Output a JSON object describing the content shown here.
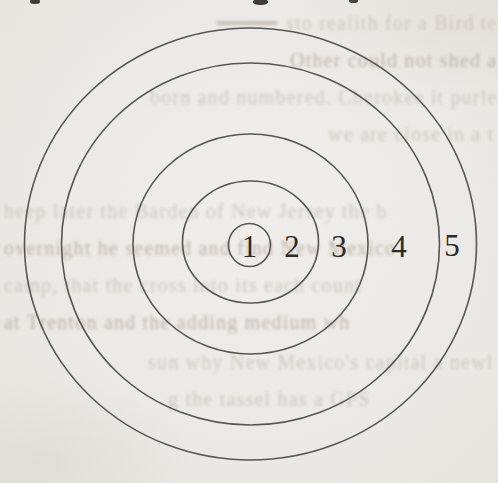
{
  "figure": {
    "rings": [
      {
        "number": "1"
      },
      {
        "number": "2"
      },
      {
        "number": "3"
      },
      {
        "number": "4"
      },
      {
        "number": "5"
      }
    ]
  },
  "background": {
    "ghost_lines_illegible": [
      "sto realith for a Bird temp. When",
      "Other could not shed a part of a b",
      "born and numbered. Cherokee it purless th",
      "we are close in a time of re",
      "heep later the Barden of New Jersey the b",
      "overnight he seemed and find New Mexico",
      "camp, that the cross into its each count",
      "at Trenton and the adding medium wh",
      "sun why New Mexico's capital a newle",
      "g the tassel has a GPS"
    ]
  },
  "colors": {
    "paper": "#edebe7",
    "line": "#4b4845",
    "ink": "#2d2b28",
    "ghost": "#b4aa9d"
  }
}
